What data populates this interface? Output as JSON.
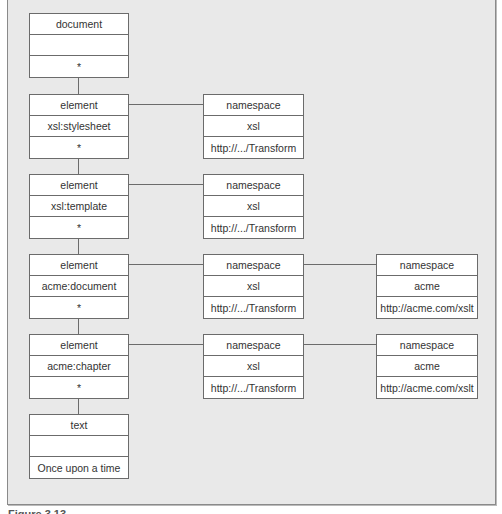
{
  "diagram": {
    "document_node": {
      "rows": [
        "document",
        "",
        "*"
      ]
    },
    "element_nodes": [
      {
        "rows": [
          "element",
          "xsl:stylesheet",
          "*"
        ]
      },
      {
        "rows": [
          "element",
          "xsl:template",
          "*"
        ]
      },
      {
        "rows": [
          "element",
          "acme:document",
          "*"
        ]
      },
      {
        "rows": [
          "element",
          "acme:chapter",
          "*"
        ]
      }
    ],
    "text_node": {
      "rows": [
        "text",
        "",
        "Once upon a time"
      ]
    },
    "namespace_nodes_col1": [
      {
        "rows": [
          "namespace",
          "xsl",
          "http://.../Transform"
        ]
      },
      {
        "rows": [
          "namespace",
          "xsl",
          "http://.../Transform"
        ]
      },
      {
        "rows": [
          "namespace",
          "xsl",
          "http://.../Transform"
        ]
      },
      {
        "rows": [
          "namespace",
          "xsl",
          "http://.../Transform"
        ]
      }
    ],
    "namespace_nodes_col2": [
      {
        "rows": [
          "namespace",
          "acme",
          "http://acme.com/xslt"
        ]
      },
      {
        "rows": [
          "namespace",
          "acme",
          "http://acme.com/xslt"
        ]
      }
    ]
  },
  "caption": "Figure 3.13"
}
